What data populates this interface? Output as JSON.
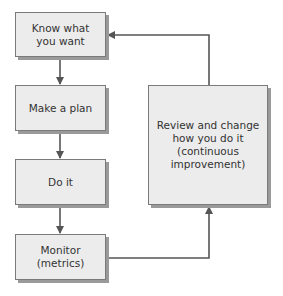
{
  "diagram": {
    "type": "flowchart",
    "nodes": [
      {
        "id": "know",
        "label": "Know what\nyou want"
      },
      {
        "id": "plan",
        "label": "Make a plan"
      },
      {
        "id": "do",
        "label": "Do it"
      },
      {
        "id": "monitor",
        "label": "Monitor\n(metrics)"
      },
      {
        "id": "review",
        "label": "Review and change\nhow you do it\n(continuous\nimprovement)"
      }
    ],
    "edges": [
      {
        "from": "know",
        "to": "plan"
      },
      {
        "from": "plan",
        "to": "do"
      },
      {
        "from": "do",
        "to": "monitor"
      },
      {
        "from": "monitor",
        "to": "review"
      },
      {
        "from": "review",
        "to": "know"
      }
    ],
    "colors": {
      "box_fill": "#ececec",
      "box_border": "#7a7a7a",
      "shadow": "#9a9a9a",
      "arrow": "#555555"
    }
  }
}
